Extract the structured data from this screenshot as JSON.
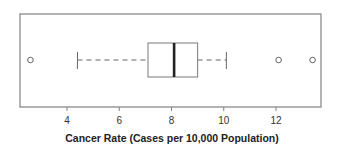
{
  "chart_data": {
    "type": "boxplot",
    "orientation": "horizontal",
    "title": "",
    "xlabel": "Cancer Rate (Cases per 10,000 Population)",
    "ylabel": "",
    "xlim": [
      2.2,
      13.8
    ],
    "xticks": [
      4,
      6,
      8,
      10,
      12
    ],
    "xtick_labels": [
      "4",
      "6",
      "8",
      "10",
      "12"
    ],
    "grid": false,
    "legend": null,
    "series": [
      {
        "name": "Cancer Rate",
        "whisker_low": 4.4,
        "q1": 7.1,
        "median": 8.1,
        "q3": 9.0,
        "whisker_high": 10.1,
        "outliers": [
          2.6,
          12.1,
          13.4
        ]
      }
    ]
  },
  "colors": {
    "frame": "#808080",
    "box": "#7a7a7a",
    "median": "#222222",
    "whisker": "#666666",
    "outlier": "#666666",
    "text": "#333333"
  }
}
